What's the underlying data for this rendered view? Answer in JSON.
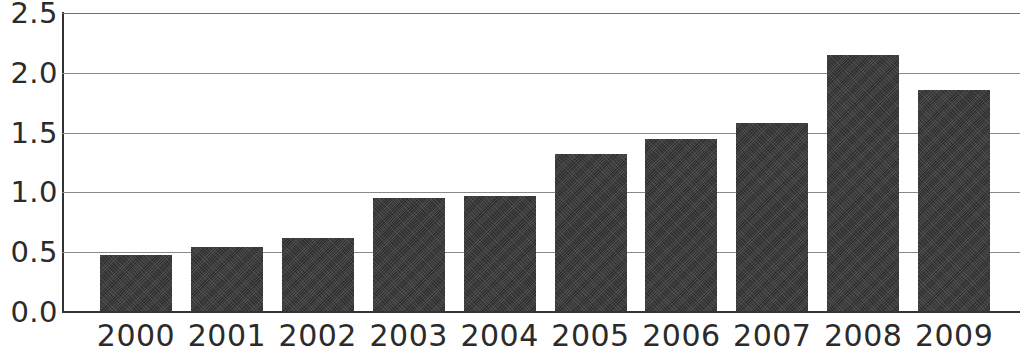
{
  "chart_data": {
    "type": "bar",
    "title": "",
    "subtitle": "",
    "xlabel": "",
    "ylabel": "",
    "categories": [
      "2000",
      "2001",
      "2002",
      "2003",
      "2004",
      "2005",
      "2006",
      "2007",
      "2008",
      "2009"
    ],
    "values": [
      0.48,
      0.54,
      0.62,
      0.95,
      0.97,
      1.32,
      1.45,
      1.58,
      2.15,
      1.86
    ],
    "ylim": [
      0.0,
      2.5
    ],
    "y_ticks": [
      0.0,
      0.5,
      1.0,
      1.5,
      2.0,
      2.5
    ],
    "y_tick_labels": [
      "0.0",
      "0.5",
      "1.0",
      "1.5",
      "2.0",
      "2.5"
    ],
    "grid": true,
    "grid_axis": "y",
    "legend": false,
    "legend_position": "none",
    "bar_color": "#3a3a3a",
    "axis_color": "#333333",
    "gridline_color": "#8a8a8a",
    "background_color": "#ffffff",
    "annotations": []
  }
}
